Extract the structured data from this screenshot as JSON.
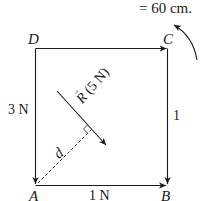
{
  "diagram": {
    "caption_fragment": "= 60 cm.",
    "vertices": {
      "top_left": "D",
      "top_right": "C",
      "bottom_left": "A",
      "bottom_right": "B"
    },
    "forces": {
      "left_side": "3 N",
      "right_side": "1",
      "bottom_side": "1 N",
      "resultant_symbol": "R",
      "resultant_value": "(5 N)"
    },
    "distance_label": "d",
    "rotation_indicator": "counterclockwise",
    "colors": {
      "line": "#1a1a1a",
      "background": "#ffffff"
    }
  }
}
